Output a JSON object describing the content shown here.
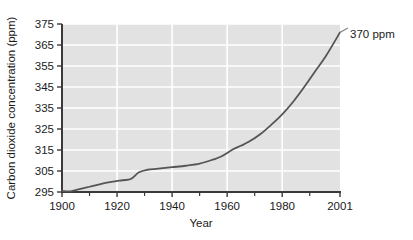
{
  "chart_data": {
    "type": "line",
    "title": "",
    "subtitle": "",
    "xlabel": "Year",
    "ylabel": "Carbon dioxide concentration (ppm)",
    "xlim": [
      1900,
      2001
    ],
    "ylim": [
      295,
      375
    ],
    "grid": true,
    "legend": "none",
    "x_tick_labels": [
      "1900",
      "1920",
      "1940",
      "1960",
      "1980",
      "2001"
    ],
    "x_tick_values": [
      1900,
      1920,
      1940,
      1960,
      1980,
      2001
    ],
    "x_minor_tick_values": [
      1910,
      1930,
      1950,
      1970,
      1990
    ],
    "y_tick_labels": [
      "295",
      "305",
      "315",
      "325",
      "335",
      "345",
      "355",
      "365",
      "375"
    ],
    "y_tick_values": [
      295,
      305,
      315,
      325,
      335,
      345,
      355,
      365,
      375
    ],
    "annotations": [
      {
        "text": "370 ppm",
        "x": 2001,
        "y": 371
      }
    ],
    "series": [
      {
        "name": "Carbon dioxide concentration",
        "color": "#555555",
        "x": [
          1900,
          1903,
          1906,
          1910,
          1914,
          1918,
          1922,
          1925,
          1928,
          1931,
          1935,
          1940,
          1945,
          1950,
          1955,
          1958,
          1962,
          1965,
          1968,
          1972,
          1976,
          1980,
          1984,
          1988,
          1992,
          1996,
          2001
        ],
        "values": [
          295.5,
          295.3,
          296.2,
          297.5,
          298.8,
          299.8,
          300.6,
          301.2,
          304.4,
          305.6,
          306.1,
          306.8,
          307.5,
          308.5,
          310.5,
          312.0,
          315.2,
          317.0,
          319.0,
          322.5,
          327.0,
          332.0,
          338.0,
          345.0,
          352.5,
          360.0,
          371.0
        ]
      }
    ]
  },
  "axes": {
    "ylabel": "Carbon dioxide concentration (ppm)",
    "xlabel": "Year"
  },
  "annotation": {
    "endpoint_label": "370 ppm"
  },
  "colors": {
    "plot_background": "#e2e2e2",
    "gridline": "#ffffff",
    "line": "#555555",
    "axis": "#3a3a3a",
    "text": "#1a1a1a",
    "page_background": "#ffffff"
  }
}
